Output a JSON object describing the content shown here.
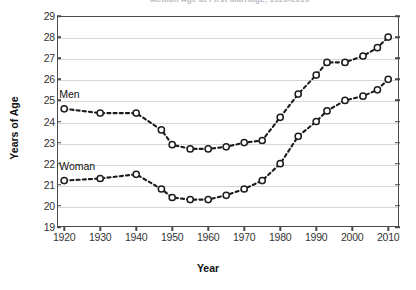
{
  "chart": {
    "title_partial": "Median Age at First Marriage, 1920-2010",
    "xlabel": "Year",
    "ylabel": "Years of Age"
  },
  "annotations": {
    "men_label": "Men",
    "woman_label": "Woman"
  },
  "chart_data": {
    "type": "line",
    "title": "Median Age at First Marriage, 1920-2010",
    "xlabel": "Year",
    "ylabel": "Years of Age",
    "xlim": [
      1918,
      2013
    ],
    "ylim": [
      19,
      29
    ],
    "yticks": [
      19,
      20,
      21,
      22,
      23,
      24,
      25,
      26,
      27,
      28,
      29
    ],
    "xticks": [
      1920,
      1930,
      1940,
      1950,
      1960,
      1970,
      1980,
      1990,
      2000,
      2010
    ],
    "grid": true,
    "legend": "inline-annotations",
    "marker": "open-circle",
    "linestyle": "dashed",
    "series": [
      {
        "name": "Men",
        "x": [
          1920,
          1930,
          1940,
          1947,
          1950,
          1955,
          1960,
          1965,
          1970,
          1975,
          1980,
          1985,
          1990,
          1993,
          1998,
          2003,
          2007,
          2010
        ],
        "values": [
          24.6,
          24.4,
          24.4,
          23.6,
          22.9,
          22.7,
          22.7,
          22.8,
          23.0,
          23.1,
          24.2,
          25.3,
          26.2,
          26.8,
          26.8,
          27.1,
          27.5,
          28.0
        ]
      },
      {
        "name": "Woman",
        "x": [
          1920,
          1930,
          1940,
          1947,
          1950,
          1955,
          1960,
          1965,
          1970,
          1975,
          1980,
          1985,
          1990,
          1993,
          1998,
          2003,
          2007,
          2010
        ],
        "values": [
          21.2,
          21.3,
          21.5,
          20.8,
          20.4,
          20.3,
          20.3,
          20.5,
          20.8,
          21.2,
          22.0,
          23.3,
          24.0,
          24.5,
          25.0,
          25.2,
          25.5,
          26.0
        ]
      }
    ]
  }
}
